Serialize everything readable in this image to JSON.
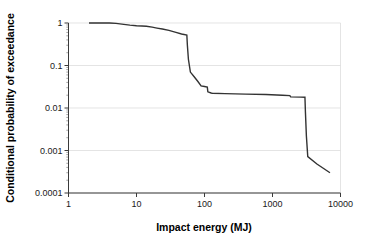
{
  "chart_data": {
    "type": "line",
    "title": "",
    "xlabel": "Impact energy (MJ)",
    "ylabel": "Conditional probability of exceedance",
    "xscale": "log",
    "yscale": "log",
    "xlim": [
      1,
      10000
    ],
    "ylim": [
      0.0001,
      1
    ],
    "xticks": [
      1,
      10,
      100,
      1000,
      10000
    ],
    "xtick_labels": [
      "1",
      "10",
      "100",
      "1000",
      "10000"
    ],
    "yticks": [
      0.0001,
      0.001,
      0.01,
      0.1,
      1
    ],
    "ytick_labels": [
      "0.0001",
      "0.001",
      "0.01",
      "0.1",
      "1"
    ],
    "grid": true,
    "grid_axis": "y",
    "legend": false,
    "series": [
      {
        "name": "Conditional exceedance curve",
        "color": "#333333",
        "x": [
          2.0,
          4.0,
          5.0,
          6.5,
          8.0,
          10.0,
          12.0,
          14.0,
          17.0,
          20.0,
          24.0,
          30.0,
          38.0,
          46.0,
          55.0,
          56.0,
          58.0,
          62.0,
          70.0,
          80.0,
          88.0,
          89.0,
          100.0,
          110.0,
          112.0,
          125.0,
          130.0,
          200.0,
          400.0,
          800.0,
          1400.0,
          1800.0,
          1850.0,
          2600.0,
          3000.0,
          3050.0,
          3150.0,
          3300.0,
          4500.0,
          7000.0
        ],
        "y": [
          1.0,
          1.0,
          0.98,
          0.93,
          0.89,
          0.86,
          0.85,
          0.84,
          0.8,
          0.76,
          0.72,
          0.67,
          0.6,
          0.55,
          0.52,
          0.3,
          0.14,
          0.07,
          0.055,
          0.042,
          0.034,
          0.033,
          0.032,
          0.031,
          0.024,
          0.0225,
          0.0222,
          0.0218,
          0.0212,
          0.0207,
          0.0199,
          0.0195,
          0.0183,
          0.018,
          0.0179,
          0.008,
          0.0022,
          0.00072,
          0.00048,
          0.0003
        ]
      }
    ]
  },
  "axes": {
    "x_title": "Impact energy (MJ)",
    "y_title": "Conditional probability of exceedance"
  }
}
